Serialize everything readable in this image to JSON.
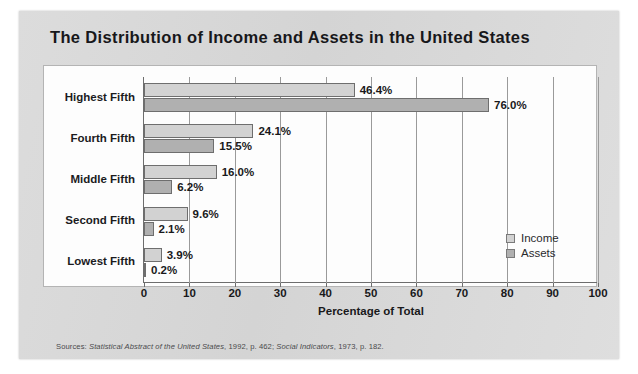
{
  "title": "The Distribution of Income and Assets in the United States",
  "source": {
    "prefix": "Sources: ",
    "work1": "Statistical Abstract of the United States",
    "mid": ", 1992, p. 462; ",
    "work2": "Social Indicators",
    "suffix": ", 1973, p. 182."
  },
  "legend": {
    "income_label": "Income",
    "assets_label": "Assets"
  },
  "colors": {
    "income": "#d2d2d2",
    "assets": "#b0b0b0",
    "card": "#d9d9d9",
    "plot_bg": "#fdfdfd",
    "axis": "#6d6d6d",
    "grid": "#9a9a9a",
    "text": "#19191b"
  },
  "chart_data": {
    "type": "bar",
    "orientation": "horizontal",
    "title": "The Distribution of Income and Assets in the United States",
    "xlabel": "Percentage of Total",
    "ylabel": "",
    "categories": [
      "Highest Fifth",
      "Fourth Fifth",
      "Middle Fifth",
      "Second Fifth",
      "Lowest Fifth"
    ],
    "series": [
      {
        "name": "Income",
        "values": [
          46.4,
          24.1,
          16.0,
          9.6,
          3.9
        ]
      },
      {
        "name": "Assets",
        "values": [
          76.0,
          15.5,
          6.2,
          2.1,
          0.2
        ]
      }
    ],
    "value_labels": [
      [
        "46.4%",
        "24.1%",
        "16.0%",
        "9.6%",
        "3.9%"
      ],
      [
        "76.0%",
        "15.5%",
        "6.2%",
        "2.1%",
        "0.2%"
      ]
    ],
    "xlim": [
      0,
      100
    ],
    "xticks": [
      0,
      10,
      20,
      30,
      40,
      50,
      60,
      70,
      80,
      90,
      100
    ],
    "xtick_labels": [
      "0",
      "10",
      "20",
      "30",
      "40",
      "50",
      "60",
      "70",
      "80",
      "90",
      "100"
    ],
    "grid": "vertical",
    "legend_position": "bottom-right"
  }
}
